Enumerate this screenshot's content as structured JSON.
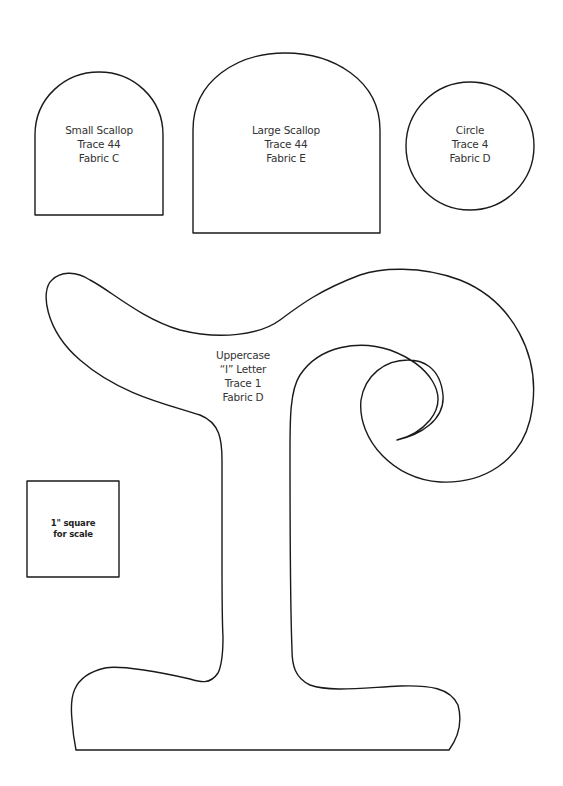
{
  "document": {
    "type": "sewing/applique pattern template",
    "line_color": "#1a1a1a",
    "background": "#ffffff"
  },
  "pieces": [
    {
      "id": "small-scallop",
      "lines": [
        "Small Scallop",
        "Trace 44",
        "Fabric C"
      ]
    },
    {
      "id": "large-scallop",
      "lines": [
        "Large Scallop",
        "Trace 44",
        "Fabric E"
      ]
    },
    {
      "id": "circle",
      "lines": [
        "Circle",
        "Trace 4",
        "Fabric D"
      ]
    },
    {
      "id": "uppercase-i-letter",
      "lines": [
        "Uppercase",
        "“I” Letter",
        "Trace 1",
        "Fabric D"
      ]
    }
  ],
  "scale_square": {
    "lines": [
      "1\" square",
      "for scale"
    ]
  }
}
